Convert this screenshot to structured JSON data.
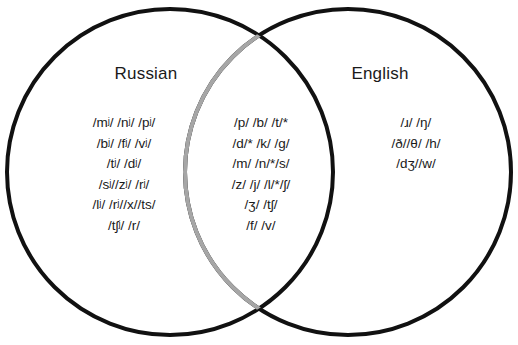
{
  "diagram": {
    "type": "venn",
    "background_color": "#ffffff",
    "left_circle": {
      "label": "Russian",
      "stroke_color": "#111111",
      "stroke_width": 4,
      "center_x": 170,
      "center_y": 172,
      "radius": 163
    },
    "right_circle": {
      "label": "English",
      "stroke_color": "#111111",
      "overlap_arc_color": "#a6a6a6",
      "stroke_width": 4,
      "center_x": 348,
      "center_y": 172,
      "radius": 163
    },
    "left_only": {
      "name": "Russian-only phonemes",
      "lines": [
        "/mʲ/ /nʲ/ /pʲ/",
        "/bʲ/ /fʲ/ /vʲ/",
        "/tʲ/ /dʲ/",
        "/sʲ//zʲ/ /rʲ/",
        "/lʲ/ /rʲ//x//ts/",
        "/tʃʲ/ /r/"
      ]
    },
    "intersection": {
      "name": "Shared phonemes",
      "lines": [
        "/p/ /b/ /t/*",
        "/d/* /k/ /g/",
        "/m/ /n/*/s/",
        "/z/ /j/ /l/*/ʃ/",
        "/ʒ/ /tʃ/",
        "/f/ /v/"
      ]
    },
    "right_only": {
      "name": "English-only phonemes",
      "lines": [
        "/ɹ/ /ŋ/",
        "/ð//θ/ /h/",
        "/dʒ//w/"
      ]
    }
  }
}
